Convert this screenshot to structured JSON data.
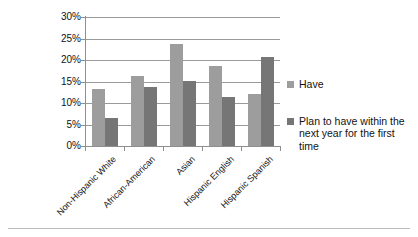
{
  "chart_data": {
    "type": "bar",
    "title": "",
    "subtitle": "",
    "xlabel": "",
    "ylabel": "",
    "ylim": [
      0,
      30
    ],
    "ytick_labels": [
      "0%",
      "5%",
      "10%",
      "15%",
      "20%",
      "25%",
      "30%"
    ],
    "ytick_values": [
      0,
      5,
      10,
      15,
      20,
      25,
      30
    ],
    "grid": "horizontal",
    "legend_position": "right",
    "categories": [
      "Non-Hispanic White",
      "African-American",
      "Asian",
      "Hispanic English",
      "Hispanic Spanish"
    ],
    "series": [
      {
        "name": "Have",
        "color": "#9d9d9d",
        "values": [
          13.3,
          16.2,
          23.8,
          18.7,
          12.1
        ]
      },
      {
        "name": "Plan to have within the next year for the first time",
        "color": "#767676",
        "values": [
          6.5,
          13.7,
          15.2,
          11.5,
          20.7
        ]
      }
    ]
  },
  "legend": {
    "entries": [
      {
        "label": "Have"
      },
      {
        "label": "Plan to have within the next year for the first time"
      }
    ]
  }
}
